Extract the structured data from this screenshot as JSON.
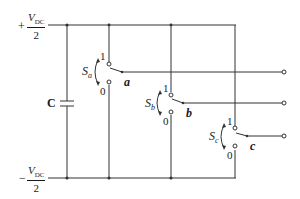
{
  "diagram": {
    "type": "three-phase two-level inverter switch model",
    "dc_link": {
      "positive_rail": {
        "sign": "+",
        "numerator": "V",
        "subscript": "DC",
        "denominator": "2"
      },
      "negative_rail": {
        "sign": "−",
        "numerator": "V",
        "subscript": "DC",
        "denominator": "2"
      },
      "capacitor_label": "C"
    },
    "legs": [
      {
        "switch_name": "S",
        "switch_sub": "a",
        "top_state": "1",
        "bottom_state": "0",
        "output": "a"
      },
      {
        "switch_name": "S",
        "switch_sub": "b",
        "top_state": "1",
        "bottom_state": "0",
        "output": "b"
      },
      {
        "switch_name": "S",
        "switch_sub": "c",
        "top_state": "1",
        "bottom_state": "0",
        "output": "c"
      }
    ],
    "colors": {
      "wire": "#333333",
      "text": "#1a1a1a",
      "background": "#ffffff"
    }
  }
}
